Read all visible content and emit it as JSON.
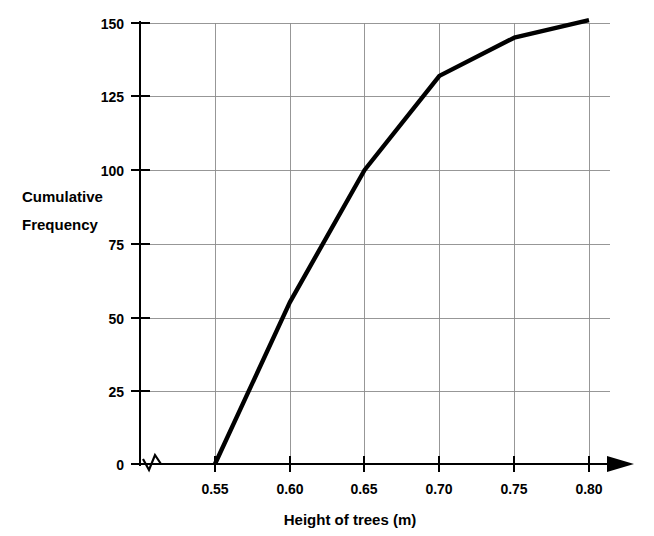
{
  "chart_data": {
    "type": "line",
    "title": "",
    "subtitle": "",
    "xlabel": "Height of trees (m)",
    "ylabel": "Cumulative Frequency",
    "ylabel_line1": "Cumulative",
    "ylabel_line2": "Frequency",
    "x": [
      0.55,
      0.6,
      0.65,
      0.7,
      0.75,
      0.8
    ],
    "values": [
      0,
      55,
      100,
      132,
      145,
      151
    ],
    "series": [
      {
        "name": "Cumulative frequency of tree heights",
        "x": [
          0.55,
          0.6,
          0.65,
          0.7,
          0.75,
          0.8
        ],
        "values": [
          0,
          55,
          100,
          132,
          145,
          151
        ]
      }
    ],
    "xlim": [
      0.55,
      0.8
    ],
    "ylim": [
      0,
      150
    ],
    "xticks": [
      0.55,
      0.6,
      0.65,
      0.7,
      0.75,
      0.8
    ],
    "xtick_labels": [
      "0.55",
      "0.60",
      "0.65",
      "0.70",
      "0.75",
      "0.80"
    ],
    "yticks": [
      0,
      25,
      50,
      75,
      100,
      125,
      150
    ],
    "ytick_labels": [
      "0",
      "25",
      "50",
      "75",
      "100",
      "125",
      "150"
    ],
    "grid": true,
    "legend": false,
    "legend_position": "none",
    "axis_break": true,
    "axis_break_note": "zigzag break on x-axis between origin and 0.55",
    "x_axis_arrow": true,
    "line_color": "#000000",
    "grid_color": "#8c8c8c",
    "axis_color": "#000000",
    "background_color": "#ffffff",
    "annotations": []
  }
}
